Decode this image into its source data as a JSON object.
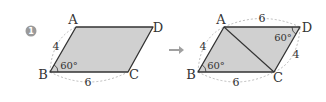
{
  "problem": {
    "number": "1",
    "badge_color": "#9a9a9a"
  },
  "colors": {
    "fill": "#d0d0d0",
    "edge": "#333333",
    "dashed": "#aaaaaa",
    "arrow": "#a0a0a0",
    "text": "#333333"
  },
  "figure_left": {
    "vertices": {
      "A": "A",
      "B": "B",
      "C": "C",
      "D": "D"
    },
    "side_AB": "4",
    "side_BC": "6",
    "angle_B": "60°"
  },
  "arrow": {
    "icon": "right-arrow-icon",
    "glyph": "→"
  },
  "figure_right": {
    "vertices": {
      "A": "A",
      "B": "B",
      "C": "C",
      "D": "D"
    },
    "side_AD": "6",
    "side_AB": "4",
    "side_BC": "6",
    "side_CD": "4",
    "angle_B": "60°",
    "angle_D": "60°",
    "diagonal": "AC"
  }
}
